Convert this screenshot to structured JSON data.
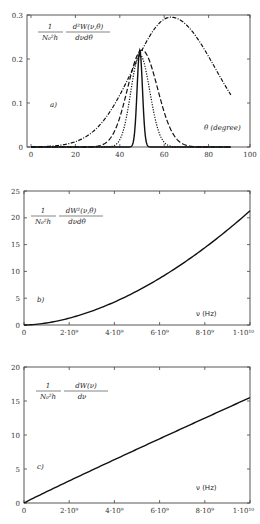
{
  "chart_data": [
    {
      "id": "a",
      "type": "line",
      "panel_label": "a)",
      "ylabel_formula": {
        "prefix_num": "1",
        "prefix_den": "N₀²h",
        "num": "d²W(ν,θ)",
        "den": "dνdθ"
      },
      "xlabel": "θ  (degree)",
      "xlim": [
        0,
        100
      ],
      "ylim": [
        0,
        0.3
      ],
      "xticks": [
        0,
        20,
        40,
        60,
        80,
        100
      ],
      "xtick_labels": [
        "0",
        "20",
        "40",
        "60",
        "80",
        "100"
      ],
      "yticks": [
        0,
        0.1,
        0.2,
        0.3
      ],
      "ytick_labels": [
        "0",
        "0.1",
        "0.2",
        "0.3"
      ],
      "grid": false,
      "series": [
        {
          "name": "dash-dot (broad)",
          "style": "dashdot",
          "model": "gauss",
          "peak_x": 63,
          "peak_y": 0.295,
          "sigma_left": 17,
          "sigma_right": 20,
          "x_range": [
            0,
            90
          ]
        },
        {
          "name": "dashed",
          "style": "dashed",
          "model": "gauss",
          "peak_x": 50,
          "peak_y": 0.22,
          "sigma_left": 6.5,
          "sigma_right": 7,
          "x_range": [
            0,
            90
          ]
        },
        {
          "name": "dotted",
          "style": "dotted",
          "model": "gauss",
          "peak_x": 49,
          "peak_y": 0.21,
          "sigma_left": 4,
          "sigma_right": 4.5,
          "x_range": [
            0,
            90
          ]
        },
        {
          "name": "solid (narrow)",
          "style": "solid",
          "model": "gauss",
          "peak_x": 49,
          "peak_y": 0.22,
          "sigma_left": 1.2,
          "sigma_right": 1.2,
          "x_range": [
            0,
            90
          ]
        }
      ]
    },
    {
      "id": "b",
      "type": "line",
      "panel_label": "b)",
      "ylabel_formula": {
        "prefix_num": "1",
        "prefix_den": "N₀²h",
        "num": "dW²(ν,θ)",
        "den": "dνdθ"
      },
      "xlabel": "ν  (Hz)",
      "xlim": [
        0,
        10000000000.0
      ],
      "ylim": [
        0,
        25
      ],
      "xticks": [
        0,
        2000000000.0,
        4000000000.0,
        6000000000.0,
        8000000000.0,
        10000000000.0
      ],
      "xtick_labels": [
        "0",
        "2·10⁹",
        "4·10⁹",
        "6·10⁹",
        "8·10⁹",
        "1·10¹⁰"
      ],
      "yticks": [
        0,
        5,
        10,
        15,
        20,
        25
      ],
      "ytick_labels": [
        "0",
        "5",
        "10",
        "15",
        "20",
        "25"
      ],
      "grid": false,
      "series": [
        {
          "name": "spectral-angular density",
          "style": "solid",
          "model": "power",
          "coef": 21.3,
          "exp": 1.75,
          "x": [
            0,
            1000000000.0,
            2000000000.0,
            3000000000.0,
            4000000000.0,
            5000000000.0,
            6000000000.0,
            7000000000.0,
            8000000000.0,
            9000000000.0,
            10000000000.0
          ],
          "y": [
            0,
            0.4,
            1.1,
            2.2,
            3.7,
            5.6,
            7.7,
            10.2,
            13.0,
            16.6,
            21.3
          ]
        }
      ]
    },
    {
      "id": "c",
      "type": "line",
      "panel_label": "c)",
      "ylabel_formula": {
        "prefix_num": "1",
        "prefix_den": "N₀²h",
        "num": "dW(ν)",
        "den": "dν"
      },
      "xlabel": "ν  (Hz)",
      "xlim": [
        0,
        10000000000.0
      ],
      "ylim": [
        0,
        20
      ],
      "xticks": [
        0,
        2000000000.0,
        4000000000.0,
        6000000000.0,
        8000000000.0,
        10000000000.0
      ],
      "xtick_labels": [
        "0",
        "2·10⁹",
        "4·10⁹",
        "6·10⁹",
        "8·10⁹",
        "1·10¹⁰"
      ],
      "yticks": [
        0,
        5,
        10,
        15,
        20
      ],
      "ytick_labels": [
        "0",
        "5",
        "10",
        "15",
        "20"
      ],
      "grid": false,
      "series": [
        {
          "name": "spectral density",
          "style": "solid",
          "model": "power",
          "coef": 15.5,
          "exp": 0.97,
          "x": [
            0,
            2000000000.0,
            4000000000.0,
            6000000000.0,
            8000000000.0,
            10000000000.0
          ],
          "y": [
            0,
            3.3,
            6.4,
            9.4,
            12.5,
            15.5
          ]
        }
      ]
    }
  ],
  "panels": {
    "a": {
      "label": "a)",
      "xlabel": "θ  (degree)"
    },
    "b": {
      "label": "b)",
      "xlabel": "ν  (Hz)"
    },
    "c": {
      "label": "c)",
      "xlabel": "ν  (Hz)"
    }
  }
}
